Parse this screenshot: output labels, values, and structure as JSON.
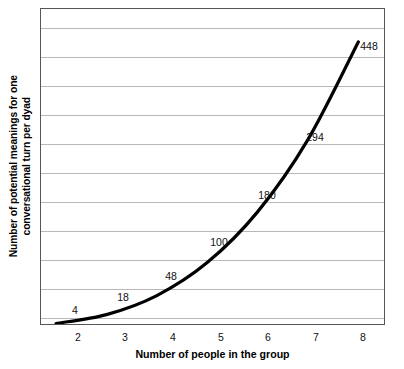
{
  "chart_data": {
    "type": "line",
    "title": "",
    "subtitle": "",
    "xlabel": "Number of people in the group",
    "ylabel_line1": "Number of potential meanings for one",
    "ylabel_line2": "conversational turn per dyad",
    "x": [
      2,
      3,
      4,
      5,
      6,
      7,
      8
    ],
    "values": [
      4,
      18,
      48,
      100,
      180,
      294,
      448
    ],
    "point_labels": [
      "4",
      "18",
      "48",
      "100",
      "180",
      "294",
      "448"
    ],
    "categories": [
      "2",
      "3",
      "4",
      "5",
      "6",
      "7",
      "8"
    ],
    "xtick_labels": [
      "2",
      "3",
      "4",
      "5",
      "6",
      "7",
      "8"
    ],
    "ytick_labels": [],
    "xlim": [
      1.7,
      8.55
    ],
    "ylim": [
      0,
      500
    ],
    "grid": {
      "horizontal": true,
      "vertical": false,
      "count": 11,
      "color": "#b8b8b8"
    },
    "legend": {
      "visible": false,
      "position": "none",
      "entries": []
    },
    "series": [
      {
        "name": "Potential meanings per dyad",
        "color": "#000000",
        "line_width": 3,
        "markers": false,
        "values": [
          4,
          18,
          48,
          100,
          180,
          294,
          448
        ]
      }
    ],
    "annotations": [
      {
        "text": "4",
        "x": 2,
        "y": 4
      },
      {
        "text": "18",
        "x": 3,
        "y": 18
      },
      {
        "text": "48",
        "x": 4,
        "y": 48
      },
      {
        "text": "100",
        "x": 5,
        "y": 100
      },
      {
        "text": "180",
        "x": 6,
        "y": 180
      },
      {
        "text": "294",
        "x": 7,
        "y": 294
      },
      {
        "text": "448",
        "x": 8,
        "y": 448
      }
    ],
    "frame": {
      "border_color": "#555555",
      "background": "#ffffff"
    }
  },
  "axes": {
    "x_title": "Number of people in the group",
    "y_title_line1": "Number of potential meanings for one",
    "y_title_line2": "conversational turn per dyad"
  },
  "ticks": {
    "x": [
      {
        "label": "2",
        "pos": 38
      },
      {
        "label": "3",
        "pos": 85
      },
      {
        "label": "4",
        "pos": 133
      },
      {
        "label": "5",
        "pos": 181
      },
      {
        "label": "6",
        "pos": 228
      },
      {
        "label": "7",
        "pos": 276
      },
      {
        "label": "8",
        "pos": 323
      }
    ]
  },
  "labels": {
    "points": [
      {
        "text": "4",
        "left": 34,
        "top": 301
      },
      {
        "text": "18",
        "left": 82,
        "top": 288
      },
      {
        "text": "48",
        "left": 130,
        "top": 267
      },
      {
        "text": "100",
        "left": 178,
        "top": 233
      },
      {
        "text": "180",
        "left": 226,
        "top": 186
      },
      {
        "text": "294",
        "left": 274,
        "top": 128
      },
      {
        "text": "448",
        "left": 328,
        "top": 37
      }
    ]
  },
  "grid": {
    "lines": [
      {
        "top": 19
      },
      {
        "top": 48
      },
      {
        "top": 77
      },
      {
        "top": 106
      },
      {
        "top": 135
      },
      {
        "top": 164
      },
      {
        "top": 193
      },
      {
        "top": 222
      },
      {
        "top": 251
      },
      {
        "top": 280
      },
      {
        "top": 309
      }
    ]
  }
}
